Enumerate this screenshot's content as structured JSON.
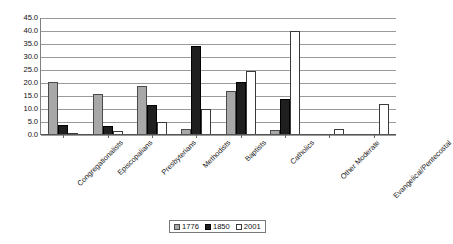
{
  "chart_data": {
    "type": "bar",
    "title": "",
    "subtitle": "",
    "xlabel": "",
    "ylabel": "",
    "ylim": [
      0.0,
      45.0
    ],
    "ytick_step": 5.0,
    "ytick_labels": [
      "45.0",
      "40.0",
      "35.0",
      "30.0",
      "25.0",
      "20.0",
      "15.0",
      "10.0",
      "5.0",
      "0.0"
    ],
    "grid": true,
    "legend_position": "bottom-center",
    "categories": [
      "Congregationalists",
      "Episcopalians",
      "Presbyterians",
      "Methodists",
      "Baptists",
      "Catholics",
      "Other Moderate",
      "Evangelical/Pentecostal"
    ],
    "series": [
      {
        "name": "1776",
        "color": "#a8a8a8",
        "values": [
          20.4,
          15.7,
          19.0,
          2.5,
          16.9,
          1.8,
          0.0,
          0.0
        ]
      },
      {
        "name": "1850",
        "color": "#1f1f1f",
        "values": [
          4.0,
          3.5,
          11.6,
          34.2,
          20.5,
          13.9,
          0.0,
          0.0
        ]
      },
      {
        "name": "2001",
        "color": "#ffffff",
        "values": [
          0.8,
          1.7,
          5.0,
          10.0,
          24.5,
          40.0,
          2.2,
          12.0
        ]
      }
    ]
  },
  "legend": {
    "entries": [
      {
        "label": "1776"
      },
      {
        "label": "1850"
      },
      {
        "label": "2001"
      }
    ]
  }
}
